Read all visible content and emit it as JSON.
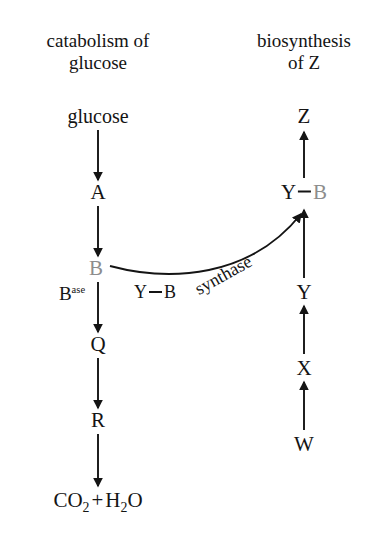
{
  "diagram": {
    "background_color": "#ffffff",
    "text_color": "#141414",
    "highlight_color": "#8d8d8d",
    "headers": {
      "left_line1": "catabolism of",
      "left_line2": "glucose",
      "right_line1": "biosynthesis",
      "right_line2": "of Z"
    },
    "left_pathway": {
      "name": "catabolism of glucose",
      "nodes": [
        {
          "label": "glucose",
          "kind": "word",
          "highlight": false
        },
        {
          "label": "A",
          "kind": "metabolite",
          "highlight": false
        },
        {
          "label": "B",
          "kind": "metabolite",
          "highlight": true
        },
        {
          "label": "Q",
          "kind": "metabolite",
          "highlight": false
        },
        {
          "label": "R",
          "kind": "metabolite",
          "highlight": false
        },
        {
          "label": "CO2 + H2O",
          "kind": "formula",
          "highlight": false
        }
      ],
      "terminal_formula": {
        "part1": "CO",
        "sub1": "2",
        "plus": "+",
        "part2": "H",
        "sub2": "2",
        "part3": "O"
      },
      "enzyme_label": {
        "base": "B",
        "suffix": "ase",
        "full": "Base"
      }
    },
    "right_pathway": {
      "name": "biosynthesis of Z",
      "nodes": [
        {
          "label": "W",
          "kind": "metabolite",
          "highlight": false
        },
        {
          "label": "X",
          "kind": "metabolite",
          "highlight": false
        },
        {
          "label": "Y",
          "kind": "metabolite",
          "highlight": false
        },
        {
          "label": "Y-B",
          "kind": "complex",
          "highlight": false
        },
        {
          "label": "Z",
          "kind": "metabolite",
          "highlight": false
        }
      ],
      "complex_node": {
        "left": "Y",
        "bond": "—",
        "right": "B",
        "right_highlight": true
      }
    },
    "cross_link": {
      "from_node": "B",
      "to_node": "Y-B",
      "enzyme_name_part1": "Y",
      "enzyme_name_bond": "—",
      "enzyme_name_part2": "B",
      "enzyme_name_suffix": "synthase",
      "enzyme_name_full": "Y—B synthase"
    }
  }
}
